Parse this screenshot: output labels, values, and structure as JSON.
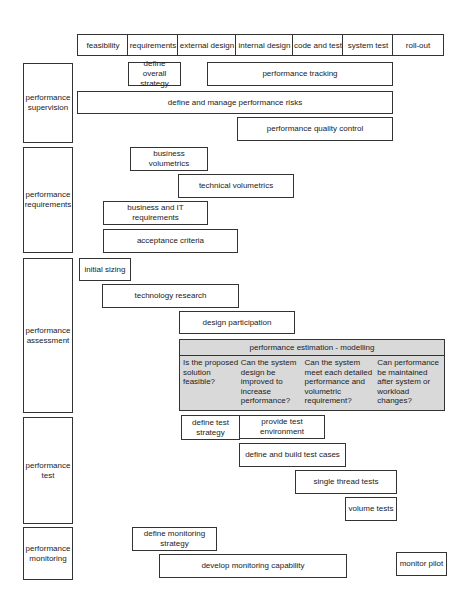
{
  "phases": [
    {
      "label": "feasibility",
      "x": 77,
      "w": 51
    },
    {
      "label": "requirements",
      "x": 128,
      "w": 50
    },
    {
      "label": "external design",
      "x": 178,
      "w": 58
    },
    {
      "label": "internal design",
      "x": 236,
      "w": 57
    },
    {
      "label": "code and test",
      "x": 293,
      "w": 50
    },
    {
      "label": "system test",
      "x": 343,
      "w": 50
    },
    {
      "label": "roll-out",
      "x": 393,
      "w": 51
    }
  ],
  "rows": [
    {
      "label": "performance supervision",
      "top": 63,
      "h": 80
    },
    {
      "label": "performance requirements",
      "top": 147,
      "h": 106
    },
    {
      "label": "performance assessment",
      "top": 258,
      "h": 155
    },
    {
      "label": "performance test",
      "top": 417,
      "h": 107
    },
    {
      "label": "performance monitoring",
      "top": 527,
      "h": 53
    }
  ],
  "activities": {
    "define_overall_strategy": "define overall strategy",
    "performance_tracking": "performance tracking",
    "define_manage_risks": "define and manage performance risks",
    "quality_control": "performance quality control",
    "business_volumetrics": "business volumetrics",
    "technical_volumetrics": "technical volumetrics",
    "business_it_requirements": "business and IT requirements",
    "acceptance_criteria": "acceptance criteria",
    "initial_sizing": "initial sizing",
    "technology_research": "technology research",
    "design_participation": "design participation",
    "define_test_strategy": "define test strategy",
    "provide_test_environment": "provide test environment",
    "define_build_test_cases": "define and build test cases",
    "single_thread_tests": "single thread tests",
    "volume_tests": "volume tests",
    "define_monitoring_strategy": "define monitoring strategy",
    "develop_monitoring_capability": "develop monitoring capability",
    "monitor_pilot": "monitor pilot"
  },
  "estimation": {
    "title": "performance estimation - modelling",
    "questions": [
      "Is the proposed solution feasible?",
      "Can the system design be improved to increase performance?",
      "Can the system meet each detailed performance and volumetric requirement?",
      "Can performance be maintained after system or workload changes?"
    ]
  }
}
